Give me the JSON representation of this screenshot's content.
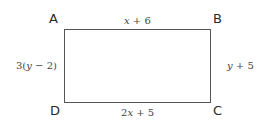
{
  "figure": {
    "shape": "rectangle",
    "vertices": {
      "top_left": "A",
      "top_right": "B",
      "bottom_right": "C",
      "bottom_left": "D"
    },
    "sides": {
      "AB": {
        "pre": "",
        "var": "x",
        "post": " + 6"
      },
      "BC": {
        "pre": "",
        "var": "y",
        "post": " + 5"
      },
      "DC": {
        "pre": "2",
        "var": "x",
        "post": " + 5"
      },
      "AD": {
        "pre": "3(",
        "var": "y",
        "post": " − 2)"
      }
    },
    "line_color": "#555555"
  }
}
